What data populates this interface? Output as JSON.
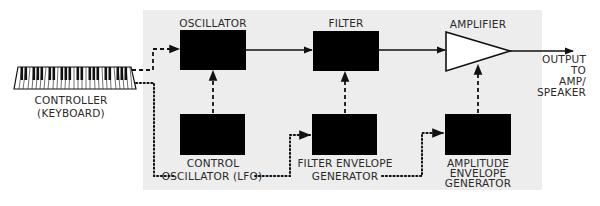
{
  "diagram": {
    "type": "synthesizer-signal-flow",
    "colors": {
      "panel": "#ededed",
      "block": "#000000",
      "line": "#111111",
      "text": "#2a2a2a"
    },
    "nodes": {
      "controller": {
        "line1": "CONTROLLER",
        "line2": "(KEYBOARD)"
      },
      "oscillator": {
        "label": "OSCILLATOR"
      },
      "filter": {
        "label": "FILTER"
      },
      "amplifier": {
        "label": "AMPLIFIER"
      },
      "lfo": {
        "line1": "CONTROL",
        "line2": "OSCILLATOR (LFO)"
      },
      "filter_env": {
        "line1": "FILTER ENVELOPE",
        "line2": "GENERATOR"
      },
      "amp_env": {
        "line1": "AMPLITUDE",
        "line2": "ENVELOPE",
        "line3": "GENERATOR"
      },
      "output": {
        "line1": "OUTPUT",
        "line2": "TO",
        "line3": "AMP/",
        "line4": "SPEAKER"
      }
    },
    "edges": [
      {
        "from": "controller",
        "to": "oscillator",
        "style": "dashed"
      },
      {
        "from": "oscillator",
        "to": "filter",
        "style": "solid"
      },
      {
        "from": "filter",
        "to": "amplifier",
        "style": "solid"
      },
      {
        "from": "amplifier",
        "to": "output",
        "style": "solid"
      },
      {
        "from": "lfo",
        "to": "oscillator",
        "style": "dashed"
      },
      {
        "from": "filter_env",
        "to": "filter",
        "style": "dashed"
      },
      {
        "from": "amp_env",
        "to": "amplifier",
        "style": "dashed"
      },
      {
        "from": "controller",
        "to": "filter_env",
        "style": "dotted"
      },
      {
        "from": "controller",
        "to": "amp_env",
        "style": "dotted"
      }
    ]
  }
}
